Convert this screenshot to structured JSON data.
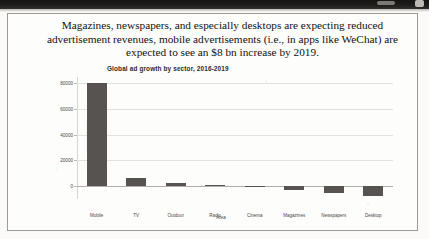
{
  "document": {
    "caption": "Magazines, newspapers, and especially desktops are expecting reduced advertisement revenues, mobile advertisements (i.e., in apps like WeChat) are expected to see an $8 bn increase by 2019."
  },
  "chart_data": {
    "type": "bar",
    "title": "Global ad growth by sector, 2016-2019",
    "xlabel": "Area",
    "ylabel": "Growth (in US$ millions)",
    "categories": [
      "Mobile",
      "TV",
      "Outdoor",
      "Radio",
      "Cinema",
      "Magazines",
      "Newspapers",
      "Desktop"
    ],
    "values": [
      80000,
      6000,
      2200,
      700,
      300,
      -3000,
      -5500,
      -8000
    ],
    "ylim": [
      -10000,
      85000
    ],
    "yticks": [
      0,
      20000,
      40000,
      60000,
      80000
    ],
    "ytick_labels": [
      "0",
      "20000",
      "40000",
      "60000",
      "80000"
    ],
    "grid": true,
    "legend": "none",
    "bar_color": "#565350"
  }
}
